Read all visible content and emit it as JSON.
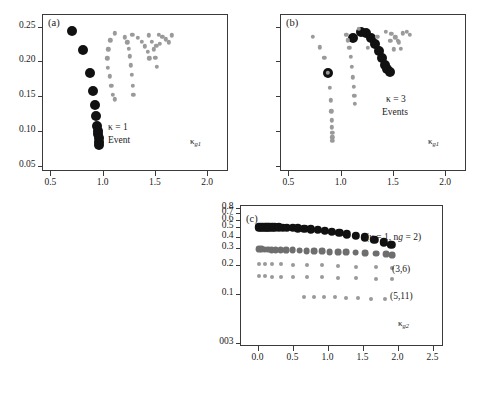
{
  "figure": {
    "background": "#ffffff",
    "dot_color_primary": "#111111",
    "dot_color_secondary": "#9a9a9a"
  },
  "panels": [
    {
      "id": "a",
      "tag": "(a)",
      "annotation_line1": "κ = 1",
      "annotation_line2": "Event",
      "xaxis_label_base": "κ",
      "xaxis_label_sub": "g1",
      "x_ticks": [
        "0.5",
        "1.0",
        "1.5",
        "2.0"
      ],
      "x_tick_values": [
        0.5,
        1.0,
        1.5,
        2.0
      ],
      "y_ticks": [
        "0.25",
        "0.20",
        "0.15",
        "0.10",
        "0.05"
      ],
      "y_tick_values": [
        0.25,
        0.2,
        0.15,
        0.1,
        0.05
      ],
      "xlim": [
        0.42,
        2.2
      ],
      "ylim": [
        0.043,
        0.268
      ]
    },
    {
      "id": "b",
      "tag": "(b)",
      "annotation_line1": "κ = 3",
      "annotation_line2": "Events",
      "xaxis_label_base": "κ",
      "xaxis_label_sub": "g1",
      "x_ticks": [
        "0.5",
        "1.0",
        "1.5",
        "2.0"
      ],
      "x_tick_values": [
        0.5,
        1.0,
        1.5,
        2.0
      ],
      "y_ticks": [],
      "y_tick_values": [
        0.25,
        0.2,
        0.15,
        0.1,
        0.05
      ],
      "xlim": [
        0.42,
        2.2
      ],
      "ylim": [
        0.043,
        0.268
      ]
    },
    {
      "id": "c",
      "tag": "(c)",
      "annotation_main": "(κ = 1, n",
      "annotation_main_sub": "g",
      "annotation_main_tail": " = 2)",
      "annotation_2": "(3,6)",
      "annotation_3": "(5,11)",
      "xaxis_label_base": "κ",
      "xaxis_label_sub": "g2",
      "x_ticks": [
        "0.0",
        "0.5",
        "1.0",
        "1.5",
        "2.0",
        "2.5"
      ],
      "x_tick_values": [
        0.0,
        0.5,
        1.0,
        1.5,
        2.0,
        2.5
      ],
      "y_ticks": [
        "0.8",
        "0.7",
        "0.6",
        "0.5",
        "0.4",
        "0.3",
        "0.2",
        "0.1",
        "003"
      ],
      "y_tick_values": [
        0.8,
        0.7,
        0.6,
        0.5,
        0.4,
        0.3,
        0.2,
        0.1,
        0.03
      ],
      "xlim": [
        -0.25,
        2.65
      ],
      "ylim": [
        0.028,
        0.86
      ],
      "yscale": "log"
    }
  ],
  "chart_data": [
    {
      "type": "scatter",
      "panel": "a",
      "title": "(a)",
      "xlabel": "κ_g1",
      "ylabel": "",
      "xlim": [
        0.42,
        2.2
      ],
      "ylim": [
        0.043,
        0.268
      ],
      "grid": false,
      "legend": "none",
      "series": [
        {
          "name": "primary-branch",
          "color": "#111111",
          "marker_size": 5.0,
          "x": [
            0.705,
            0.815,
            0.875,
            0.905,
            0.925,
            0.938,
            0.948,
            0.955,
            0.958,
            0.962,
            0.965,
            0.966
          ],
          "y": [
            0.2435,
            0.2165,
            0.1835,
            0.157,
            0.137,
            0.1215,
            0.1075,
            0.1005,
            0.0955,
            0.0905,
            0.0845,
            0.0805
          ]
        },
        {
          "name": "secondary-branch-1",
          "color": "#9a9a9a",
          "marker_size": 2.2,
          "x": [
            1.115,
            1.075,
            1.055,
            1.045,
            1.052,
            1.068,
            1.085,
            1.1,
            1.115
          ],
          "y": [
            0.2405,
            0.2305,
            0.2175,
            0.2045,
            0.191,
            0.1785,
            0.1655,
            0.152,
            0.1455
          ]
        },
        {
          "name": "secondary-branch-2",
          "color": "#9a9a9a",
          "marker_size": 2.2,
          "x": [
            1.215,
            1.235,
            1.252,
            1.262,
            1.272,
            1.282,
            1.288,
            1.292
          ],
          "y": [
            0.2345,
            0.2275,
            0.2185,
            0.2075,
            0.1945,
            0.1805,
            0.165,
            0.1525
          ]
        },
        {
          "name": "secondary-branch-3",
          "color": "#9a9a9a",
          "marker_size": 2.2,
          "x": [
            1.285,
            1.335,
            1.375,
            1.405,
            1.43,
            1.448
          ],
          "y": [
            0.2385,
            0.2335,
            0.2285,
            0.2215,
            0.2135,
            0.2045
          ]
        },
        {
          "name": "secondary-branch-4",
          "color": "#9a9a9a",
          "marker_size": 2.2,
          "x": [
            1.445,
            1.468,
            1.488,
            1.505,
            1.518
          ],
          "y": [
            0.2375,
            0.2285,
            0.2175,
            0.2055,
            0.1925
          ]
        },
        {
          "name": "secondary-branch-5",
          "color": "#9a9a9a",
          "marker_size": 2.2,
          "x": [
            1.535,
            1.572,
            1.605,
            1.635,
            1.662
          ],
          "y": [
            0.2385,
            0.2355,
            0.2315,
            0.2275,
            0.2375
          ]
        },
        {
          "name": "secondary-branch-6",
          "color": "#9a9a9a",
          "marker_size": 2.2,
          "x": [
            1.515,
            1.545
          ],
          "y": [
            0.2225,
            0.2255
          ]
        }
      ]
    },
    {
      "type": "scatter",
      "panel": "b",
      "title": "(b)",
      "xlabel": "κ_g1",
      "ylabel": "",
      "xlim": [
        0.42,
        2.2
      ],
      "ylim": [
        0.043,
        0.268
      ],
      "grid": false,
      "legend": "none",
      "series": [
        {
          "name": "isolated-point",
          "color": "#111111",
          "marker_size": 5.0,
          "x": [
            0.882
          ],
          "y": [
            0.1835
          ]
        },
        {
          "name": "primary-arc",
          "color": "#111111",
          "marker_size": 5.0,
          "x": [
            1.115,
            1.195,
            1.245,
            1.292,
            1.332,
            1.368,
            1.398,
            1.425,
            1.448,
            1.468
          ],
          "y": [
            0.2335,
            0.2425,
            0.2405,
            0.2335,
            0.2245,
            0.2145,
            0.2045,
            0.1955,
            0.1885,
            0.1845
          ]
        },
        {
          "name": "grey-chain-left",
          "color": "#9a9a9a",
          "marker_size": 2.2,
          "x": [
            0.735,
            0.8,
            0.845,
            0.875,
            0.895,
            0.905,
            0.912,
            0.915,
            0.918,
            0.92,
            0.921,
            0.922
          ],
          "y": [
            0.2355,
            0.2205,
            0.2055,
            0.1835,
            0.1625,
            0.1445,
            0.1285,
            0.1155,
            0.1055,
            0.0975,
            0.0915,
            0.0865
          ]
        },
        {
          "name": "grey-chain-mid",
          "color": "#9a9a9a",
          "marker_size": 2.2,
          "x": [
            1.055,
            1.068,
            1.082,
            1.095,
            1.105,
            1.115,
            1.125,
            1.132,
            1.138
          ],
          "y": [
            0.2385,
            0.2305,
            0.2195,
            0.2065,
            0.1925,
            0.1775,
            0.1635,
            0.1505,
            0.1395
          ]
        },
        {
          "name": "grey-chain-right",
          "color": "#9a9a9a",
          "marker_size": 2.2,
          "x": [
            1.485,
            1.525,
            1.555,
            1.578
          ],
          "y": [
            0.2395,
            0.2345,
            0.2275,
            0.2185
          ]
        },
        {
          "name": "grey-chain-far",
          "color": "#9a9a9a",
          "marker_size": 2.2,
          "x": [
            1.595,
            1.632,
            1.662
          ],
          "y": [
            0.2405,
            0.2425,
            0.2385
          ]
        },
        {
          "name": "grey-scatter-misc",
          "color": "#9a9a9a",
          "marker_size": 2.2,
          "x": [
            1.175,
            1.262,
            1.352,
            1.432,
            1.475,
            1.512,
            1.545
          ],
          "y": [
            0.2465,
            0.2195,
            0.2355,
            0.2425,
            0.2295,
            0.2175,
            0.2295
          ]
        }
      ]
    },
    {
      "type": "scatter",
      "panel": "c",
      "title": "(c)",
      "xlabel": "κ_g2",
      "ylabel": "",
      "xlim": [
        -0.25,
        2.65
      ],
      "ylim": [
        0.028,
        0.86
      ],
      "yscale": "log",
      "grid": false,
      "legend": "none",
      "annotations": [
        "(κ = 1, n_g = 2)",
        "(3,6)",
        "(5,11)"
      ],
      "series": [
        {
          "name": "top-branch-k1-ng2",
          "color": "#111111",
          "marker_size": 4.2,
          "x": [
            0.02,
            0.05,
            0.08,
            0.11,
            0.14,
            0.17,
            0.21,
            0.25,
            0.3,
            0.36,
            0.42,
            0.5,
            0.58,
            0.67,
            0.76,
            0.86,
            0.96,
            1.06,
            1.17,
            1.28,
            1.4,
            1.53,
            1.67,
            1.8,
            1.91
          ],
          "y": [
            0.502,
            0.502,
            0.502,
            0.501,
            0.501,
            0.5,
            0.5,
            0.499,
            0.498,
            0.496,
            0.494,
            0.491,
            0.487,
            0.481,
            0.475,
            0.468,
            0.459,
            0.449,
            0.437,
            0.424,
            0.409,
            0.392,
            0.372,
            0.349,
            0.326
          ]
        },
        {
          "name": "band-3-6-dense",
          "color": "#6e6e6e",
          "marker_size": 3.4,
          "x": [
            0.02,
            0.06,
            0.1,
            0.15,
            0.2,
            0.26,
            0.33,
            0.41,
            0.5,
            0.6,
            0.7,
            0.81,
            0.92,
            1.03,
            1.15,
            1.27,
            1.4,
            1.54,
            1.69,
            1.84,
            1.92
          ],
          "y": [
            0.292,
            0.292,
            0.291,
            0.291,
            0.29,
            0.289,
            0.288,
            0.287,
            0.285,
            0.284,
            0.282,
            0.28,
            0.278,
            0.276,
            0.274,
            0.272,
            0.27,
            0.267,
            0.264,
            0.26,
            0.257
          ]
        },
        {
          "name": "band-3-6-tails",
          "color": "#9a9a9a",
          "marker_size": 2.0,
          "x": [
            0.02,
            0.1,
            0.2,
            0.33,
            0.5,
            0.7,
            0.92,
            1.15,
            1.4,
            1.69,
            1.92
          ],
          "y": [
            0.205,
            0.205,
            0.204,
            0.203,
            0.202,
            0.2,
            0.198,
            0.196,
            0.193,
            0.19,
            0.187
          ]
        },
        {
          "name": "band-5-11",
          "color": "#9a9a9a",
          "marker_size": 2.0,
          "x": [
            0.02,
            0.1,
            0.2,
            0.33,
            0.5,
            0.7,
            0.92,
            1.15,
            1.4,
            1.69,
            1.92
          ],
          "y": [
            0.152,
            0.152,
            0.151,
            0.151,
            0.15,
            0.149,
            0.148,
            0.146,
            0.145,
            0.143,
            0.141
          ]
        },
        {
          "name": "lower-sparse-band",
          "color": "#9a9a9a",
          "marker_size": 2.0,
          "x": [
            0.67,
            0.81,
            0.95,
            1.1,
            1.26,
            1.43,
            1.62,
            1.82
          ],
          "y": [
            0.092,
            0.092,
            0.091,
            0.091,
            0.09,
            0.089,
            0.088,
            0.087
          ]
        }
      ]
    }
  ]
}
